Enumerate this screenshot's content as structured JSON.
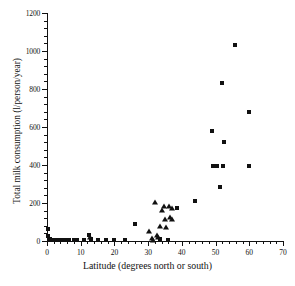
{
  "chart_data": {
    "type": "scatter",
    "title": "",
    "xlabel": "Latitude (degrees north or south)",
    "ylabel": "Total milk consumption (l/person/year)",
    "xlim": [
      0,
      70
    ],
    "ylim": [
      0,
      1200
    ],
    "xticks": [
      0,
      10,
      20,
      30,
      40,
      50,
      60,
      70
    ],
    "yticks": [
      0,
      200,
      400,
      600,
      800,
      1000,
      1200
    ],
    "xtick_labels": [
      "0",
      "10",
      "20",
      "30",
      "40",
      "50",
      "60",
      "70"
    ],
    "ytick_labels": [
      "0",
      "200",
      "400",
      "600",
      "800",
      "1000",
      "1200"
    ],
    "x_minor_tick_step": 2,
    "y_minor_tick_step": 40,
    "grid": false,
    "legend": false,
    "marker_color": "#111111",
    "series": [
      {
        "name": "square-series",
        "marker": "square",
        "points": [
          [
            0.4,
            65
          ],
          [
            0.3,
            25
          ],
          [
            1.0,
            8
          ],
          [
            2.0,
            6
          ],
          [
            3.2,
            5
          ],
          [
            4.3,
            6
          ],
          [
            5.4,
            5
          ],
          [
            6.5,
            6
          ],
          [
            8.0,
            5
          ],
          [
            9.0,
            5
          ],
          [
            11.0,
            5
          ],
          [
            12.5,
            30
          ],
          [
            13.0,
            8
          ],
          [
            15.2,
            6
          ],
          [
            17.5,
            5
          ],
          [
            19.8,
            5
          ],
          [
            23.2,
            4
          ],
          [
            26.2,
            90
          ],
          [
            33.5,
            8
          ],
          [
            36.0,
            6
          ],
          [
            38.5,
            175
          ],
          [
            44.0,
            210
          ],
          [
            48.8,
            580
          ],
          [
            49.2,
            395
          ],
          [
            50.3,
            395
          ],
          [
            51.2,
            285
          ],
          [
            52.3,
            395
          ],
          [
            52.0,
            830
          ],
          [
            52.5,
            520
          ],
          [
            55.8,
            1030
          ],
          [
            59.8,
            680
          ],
          [
            60.0,
            395
          ]
        ]
      },
      {
        "name": "triangle-series",
        "marker": "triangle",
        "points": [
          [
            12.8,
            22
          ],
          [
            30.2,
            55
          ],
          [
            31.0,
            18
          ],
          [
            31.5,
            8
          ],
          [
            32.0,
            210
          ],
          [
            32.6,
            35
          ],
          [
            33.0,
            22
          ],
          [
            33.4,
            80
          ],
          [
            34.0,
            165
          ],
          [
            34.8,
            185
          ],
          [
            35.0,
            120
          ],
          [
            35.3,
            75
          ],
          [
            36.2,
            185
          ],
          [
            36.5,
            130
          ],
          [
            37.0,
            175
          ],
          [
            37.2,
            120
          ]
        ]
      }
    ]
  }
}
